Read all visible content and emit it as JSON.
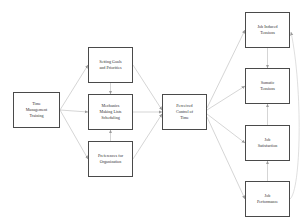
{
  "diagram": {
    "background_color": "#ffffff",
    "node_border_color": "#4a4a4a",
    "edge_color": "#b9b9b9",
    "text_color": "#2e2e2e",
    "nodes": [
      {
        "id": "time-management-training",
        "label": "Time\nManagement\nTraining",
        "column": "antecedent",
        "x": 13,
        "y": 92,
        "width": 47,
        "height": 36
      },
      {
        "id": "setting-goals-and-priorities",
        "label": "Setting Goals\nand Priorities",
        "column": "behavior",
        "x": 88,
        "y": 47,
        "width": 45,
        "height": 36
      },
      {
        "id": "mechanics-making-lists-scheduling",
        "label": "Mechanics\nMaking Lists\nScheduling",
        "column": "behavior",
        "x": 88,
        "y": 94,
        "width": 45,
        "height": 36
      },
      {
        "id": "preferences-for-organization",
        "label": "Preferences for\nOrganization",
        "column": "behavior",
        "x": 88,
        "y": 141,
        "width": 45,
        "height": 36
      },
      {
        "id": "perceived-control-of-time",
        "label": "Perceived\nControl of\nTime",
        "column": "mediator",
        "x": 162,
        "y": 94,
        "width": 45,
        "height": 36
      },
      {
        "id": "job-induced-tensions",
        "label": "Job Induced\nTensions",
        "column": "outcome",
        "x": 245,
        "y": 12,
        "width": 45,
        "height": 36
      },
      {
        "id": "somatic-tensions",
        "label": "Somatic\nTensions",
        "column": "outcome",
        "x": 245,
        "y": 68,
        "width": 45,
        "height": 36
      },
      {
        "id": "job-satisfaction",
        "label": "Job\nSatisfaction",
        "column": "outcome",
        "x": 245,
        "y": 125,
        "width": 45,
        "height": 36
      },
      {
        "id": "job-performance",
        "label": "Job\nPerformance",
        "column": "outcome",
        "x": 245,
        "y": 181,
        "width": 45,
        "height": 36
      }
    ],
    "edges": [
      {
        "from": "time-management-training",
        "to": "setting-goals-and-priorities"
      },
      {
        "from": "time-management-training",
        "to": "mechanics-making-lists-scheduling"
      },
      {
        "from": "time-management-training",
        "to": "preferences-for-organization"
      },
      {
        "from": "setting-goals-and-priorities",
        "to": "mechanics-making-lists-scheduling"
      },
      {
        "from": "preferences-for-organization",
        "to": "mechanics-making-lists-scheduling"
      },
      {
        "from": "setting-goals-and-priorities",
        "to": "perceived-control-of-time"
      },
      {
        "from": "mechanics-making-lists-scheduling",
        "to": "perceived-control-of-time"
      },
      {
        "from": "preferences-for-organization",
        "to": "perceived-control-of-time"
      },
      {
        "from": "perceived-control-of-time",
        "to": "job-induced-tensions"
      },
      {
        "from": "perceived-control-of-time",
        "to": "somatic-tensions"
      },
      {
        "from": "perceived-control-of-time",
        "to": "job-satisfaction"
      },
      {
        "from": "perceived-control-of-time",
        "to": "job-performance"
      },
      {
        "from": "job-induced-tensions",
        "to": "somatic-tensions"
      },
      {
        "from": "job-satisfaction",
        "to": "somatic-tensions"
      },
      {
        "from": "job-performance",
        "to": "job-satisfaction"
      },
      {
        "from": "job-performance",
        "to": "job-induced-tensions"
      }
    ]
  }
}
